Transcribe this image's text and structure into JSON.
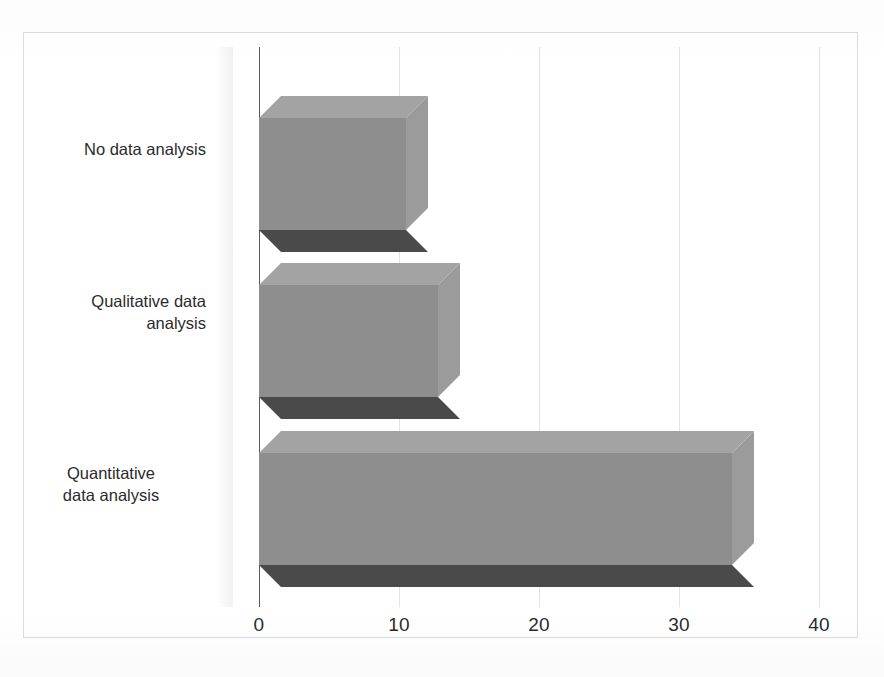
{
  "chart_data": {
    "type": "bar",
    "orientation": "horizontal",
    "style": "3d",
    "title": "",
    "subtitle": "",
    "xlabel": "",
    "ylabel": "",
    "categories": [
      "No data analysis",
      "Qualitative data analysis",
      "Quantitative data analysis"
    ],
    "values": [
      10.5,
      12.8,
      33.8
    ],
    "xticks": [
      "0",
      "10",
      "20",
      "30",
      "40"
    ],
    "xtick_values": [
      0,
      10,
      20,
      30,
      40
    ],
    "xlim": [
      0,
      40
    ],
    "grid": true,
    "grid_axis": "x",
    "legend": "none",
    "series": [
      {
        "name": "Count",
        "values": [
          10.5,
          12.8,
          33.8
        ]
      }
    ],
    "category_lines": [
      [
        "No data analysis"
      ],
      [
        "Qualitative data",
        "analysis"
      ],
      [
        "Quantitative",
        "data analysis"
      ]
    ]
  },
  "colors": {
    "bar_front": "#8e8e8e",
    "bar_top": "#a3a3a3",
    "bar_side": "#9b9b9b",
    "bar_base": "#4a4a4a",
    "gridline": "#e3e3e3",
    "axis": "#595959",
    "frame_border": "#dcdcdc",
    "background": "#ffffff",
    "text": "#2b2b2b"
  },
  "geometry": {
    "x_zero_px": 259,
    "px_per_unit": 14.0,
    "depth_px": 22
  }
}
